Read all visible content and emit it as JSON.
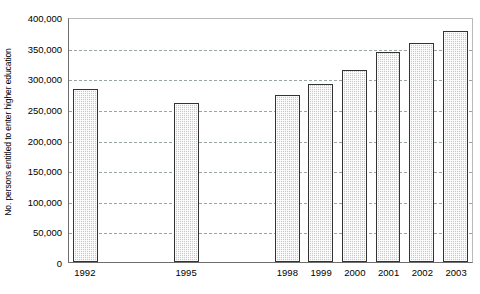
{
  "chart_data": {
    "type": "bar",
    "title": "",
    "subtitle": "",
    "xlabel": "",
    "ylabel": "No. persons entitled to enter higher education",
    "categories": [
      "1992",
      "1993",
      "1994",
      "1995",
      "1996",
      "1997",
      "1998",
      "1999",
      "2000",
      "2001",
      "2002",
      "2003"
    ],
    "values": [
      282000,
      null,
      null,
      260000,
      null,
      null,
      272000,
      290000,
      313000,
      343000,
      357000,
      377000
    ],
    "series": [
      {
        "name": "No. persons entitled to enter higher education",
        "values": [
          282000,
          null,
          null,
          260000,
          null,
          null,
          272000,
          290000,
          313000,
          343000,
          357000,
          377000
        ]
      }
    ],
    "ylim": [
      0,
      400000
    ],
    "ytick_values": [
      0,
      50000,
      100000,
      150000,
      200000,
      250000,
      300000,
      350000,
      400000
    ],
    "ytick_labels": [
      "0",
      "50,000",
      "100,000",
      "150,000",
      "200,000",
      "250,000",
      "300,000",
      "350,000",
      "400,000"
    ],
    "xtick_labels": [
      "1992",
      "",
      "",
      "1995",
      "",
      "",
      "1998",
      "1999",
      "2000",
      "2001",
      "2002",
      "2003"
    ],
    "grid": true,
    "grid_axis": "y",
    "grid_style": "dashed",
    "legend": false,
    "legend_position": "none",
    "bar_fill_color": "#c9c9c9",
    "bar_border_color": "#333333",
    "gridline_color": "#9aa5a5",
    "axis_color": "#6e6e6e",
    "background_color": "#ffffff"
  }
}
